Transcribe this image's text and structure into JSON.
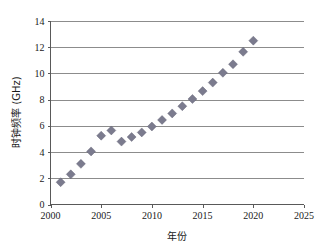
{
  "chart_data": {
    "type": "scatter",
    "title": "",
    "xlabel": "年份",
    "ylabel": "时钟频率 (GHz)",
    "xlim": [
      2000,
      2025
    ],
    "ylim": [
      0,
      14
    ],
    "grid": true,
    "grid_axis": "y",
    "legend": "none",
    "marker": {
      "shape": "diamond",
      "color": "#7b7b8e",
      "size": 5
    },
    "xticks": [
      2000,
      2005,
      2010,
      2015,
      2020,
      2025
    ],
    "xtick_labels": [
      "2000",
      "2005",
      "2010",
      "2015",
      "2020",
      "2025"
    ],
    "yticks": [
      0,
      2,
      4,
      6,
      8,
      10,
      12,
      14
    ],
    "ytick_labels": [
      "0",
      "2",
      "4",
      "6",
      "8",
      "10",
      "12",
      "14"
    ],
    "x": [
      2001,
      2002,
      2003,
      2004,
      2005,
      2006,
      2007,
      2008,
      2009,
      2010,
      2011,
      2012,
      2013,
      2014,
      2015,
      2016,
      2017,
      2018,
      2019,
      2020
    ],
    "values": [
      1.7,
      2.3,
      3.1,
      4.05,
      5.25,
      5.65,
      4.8,
      5.15,
      5.5,
      5.95,
      6.45,
      6.95,
      7.5,
      8.05,
      8.65,
      9.3,
      10.05,
      10.7,
      11.65,
      12.5
    ],
    "series": [
      {
        "name": "时钟频率",
        "values": [
          1.7,
          2.3,
          3.1,
          4.05,
          5.25,
          5.65,
          4.8,
          5.15,
          5.5,
          5.95,
          6.45,
          6.95,
          7.5,
          8.05,
          8.65,
          9.3,
          10.05,
          10.7,
          11.65,
          12.5
        ]
      }
    ]
  },
  "axes": {
    "x_title": "年份",
    "y_title": "时钟频率 (GHz)"
  },
  "colors": {
    "marker": "#7b7b8e",
    "grid": "#8c8c8c",
    "axis": "#595959",
    "background": "#ffffff",
    "text": "#1a1a1a"
  }
}
